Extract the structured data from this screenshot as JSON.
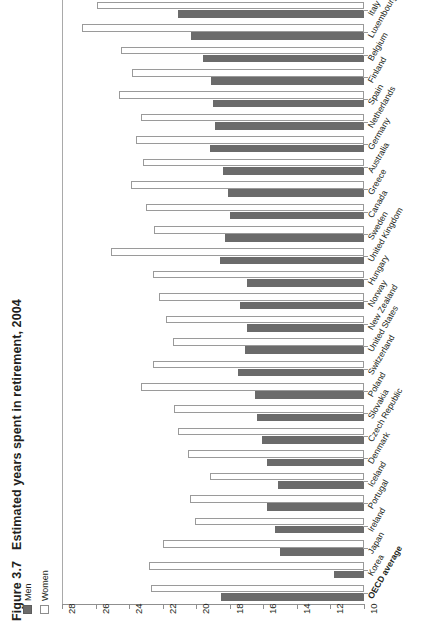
{
  "figure": {
    "number": "Figure 3.7",
    "title": "Estimated years spent in retirement, 2004"
  },
  "legend": {
    "items": [
      {
        "label": "Men",
        "color": "#6b6b6b",
        "style": "filled"
      },
      {
        "label": "Women",
        "color": "#ffffff",
        "style": "outline"
      }
    ]
  },
  "axis": {
    "ticks": [
      "28",
      "26",
      "24",
      "22",
      "20",
      "18",
      "16",
      "14",
      "12",
      "10"
    ],
    "min": 10,
    "max": 28,
    "reversed": true
  },
  "chart_data": {
    "type": "bar",
    "orientation": "horizontal",
    "title": "Estimated years spent in retirement, 2004",
    "xlabel": "",
    "ylabel": "",
    "xlim": [
      28,
      10
    ],
    "grid": false,
    "legend_position": "bottom-left",
    "categories": [
      "Austria",
      "Italy",
      "Luxembourg",
      "Belgium",
      "Finland",
      "Spain",
      "Netherlands",
      "Germany",
      "Australia",
      "Greece",
      "Canada",
      "Sweden",
      "United Kingdom",
      "Hungary",
      "Norway",
      "New Zealand",
      "United States",
      "Switzerland",
      "Poland",
      "Slovakia",
      "Czech Republic",
      "Denmark",
      "Iceland",
      "Portugal",
      "Ireland",
      "Japan",
      "Korea",
      "OECD average"
    ],
    "series": [
      {
        "name": "Men",
        "color": "#6b6b6b",
        "values": [
          21.3,
          21.1,
          20.3,
          19.6,
          19.1,
          19.0,
          18.9,
          19.2,
          18.4,
          18.1,
          18.0,
          18.3,
          18.6,
          17.0,
          17.4,
          17.0,
          17.1,
          17.5,
          16.5,
          16.4,
          16.1,
          15.8,
          15.1,
          15.8,
          15.3,
          15.0,
          11.8,
          18.5
        ]
      },
      {
        "name": "Women",
        "color": "#ffffff",
        "values": [
          25.7,
          25.9,
          26.8,
          24.5,
          23.8,
          24.6,
          23.3,
          23.6,
          23.2,
          23.9,
          23.0,
          22.5,
          25.1,
          22.6,
          22.2,
          21.8,
          21.4,
          22.6,
          23.3,
          21.3,
          21.1,
          20.5,
          19.2,
          20.4,
          20.1,
          22.0,
          22.8,
          22.7
        ]
      }
    ]
  }
}
